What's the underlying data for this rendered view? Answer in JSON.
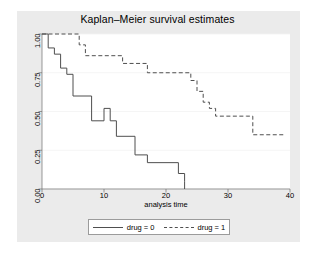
{
  "chart_data": {
    "type": "line",
    "subtype": "step-kaplan-meier",
    "title": "Kaplan–Meier survival estimates",
    "xlabel": "analysis time",
    "ylabel": "",
    "xlim": [
      0,
      40
    ],
    "ylim": [
      0,
      1
    ],
    "xticks": [
      0,
      10,
      20,
      30,
      40
    ],
    "xticklabels": [
      "0",
      "10",
      "20",
      "30",
      "40"
    ],
    "yticks": [
      0.0,
      0.25,
      0.5,
      0.75,
      1.0
    ],
    "yticklabels": [
      "0.00",
      "0.25",
      "0.50",
      "0.75",
      "1.00"
    ],
    "grid": "horizontal",
    "legend_position": "bottom-center",
    "series": [
      {
        "name": "drug = 0",
        "style": "solid",
        "color": "#4f4f4f",
        "x": [
          0,
          1,
          1,
          2,
          2,
          3,
          3,
          4,
          4,
          5,
          5,
          8,
          8,
          8,
          10,
          10,
          11,
          11,
          12,
          12,
          12,
          15,
          15,
          16,
          16,
          17,
          17,
          22,
          22,
          23,
          23,
          23
        ],
        "y": [
          1.0,
          1.0,
          0.91,
          0.91,
          0.87,
          0.87,
          0.78,
          0.78,
          0.74,
          0.74,
          0.6,
          0.6,
          0.52,
          0.44,
          0.44,
          0.52,
          0.52,
          0.44,
          0.44,
          0.34,
          0.34,
          0.34,
          0.22,
          0.22,
          0.22,
          0.22,
          0.17,
          0.17,
          0.1,
          0.1,
          0.05,
          0.0
        ],
        "steps": [
          {
            "time": 0,
            "survival": 1.0
          },
          {
            "time": 1,
            "survival": 0.91
          },
          {
            "time": 2,
            "survival": 0.87
          },
          {
            "time": 3,
            "survival": 0.78
          },
          {
            "time": 4,
            "survival": 0.74
          },
          {
            "time": 5,
            "survival": 0.6
          },
          {
            "time": 8,
            "survival": 0.44
          },
          {
            "time": 10,
            "survival": 0.52
          },
          {
            "time": 11,
            "survival": 0.44
          },
          {
            "time": 12,
            "survival": 0.34
          },
          {
            "time": 15,
            "survival": 0.22
          },
          {
            "time": 17,
            "survival": 0.17
          },
          {
            "time": 22,
            "survival": 0.1
          },
          {
            "time": 23,
            "survival": 0.05
          },
          {
            "time": 23,
            "survival": 0.0
          }
        ]
      },
      {
        "name": "drug = 1",
        "style": "dashed",
        "color": "#4f4f4f",
        "steps": [
          {
            "time": 0,
            "survival": 1.0
          },
          {
            "time": 6,
            "survival": 0.93
          },
          {
            "time": 7,
            "survival": 0.86
          },
          {
            "time": 10,
            "survival": 0.86
          },
          {
            "time": 13,
            "survival": 0.81
          },
          {
            "time": 16,
            "survival": 0.81
          },
          {
            "time": 17,
            "survival": 0.75
          },
          {
            "time": 23,
            "survival": 0.75
          },
          {
            "time": 24,
            "survival": 0.7
          },
          {
            "time": 25,
            "survival": 0.63
          },
          {
            "time": 26,
            "survival": 0.56
          },
          {
            "time": 27,
            "survival": 0.52
          },
          {
            "time": 28,
            "survival": 0.47
          },
          {
            "time": 33,
            "survival": 0.47
          },
          {
            "time": 34,
            "survival": 0.35
          },
          {
            "time": 39,
            "survival": 0.35
          }
        ]
      }
    ],
    "legend": [
      {
        "label": "drug = 0",
        "style": "solid"
      },
      {
        "label": "drug = 1",
        "style": "dashed"
      }
    ]
  },
  "colors": {
    "graph_region": "#ebebeb",
    "plot_region": "#ffffff",
    "line": "#4f4f4f",
    "gridline": "#f2f2f2",
    "axis": "#6e6e6e",
    "text": "#000000"
  }
}
